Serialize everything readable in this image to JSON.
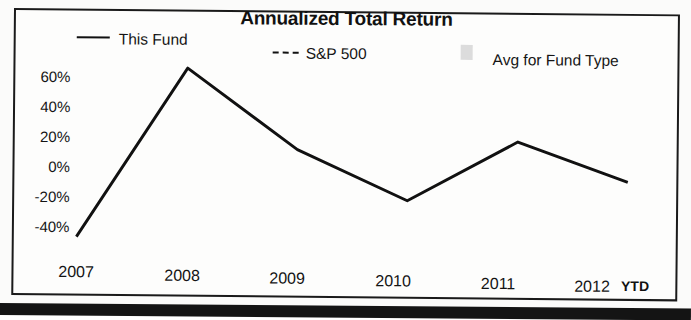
{
  "chart_data": {
    "type": "line",
    "title": "Annualized Total Return",
    "xlabel": "",
    "ylabel": "",
    "categories": [
      "2007",
      "2008",
      "2009",
      "2010",
      "2011",
      "2012"
    ],
    "x_axis_note": "YTD",
    "ylim": [
      -50,
      70
    ],
    "ytick_labels": [
      "60%",
      "40%",
      "20%",
      "0%",
      "-20%",
      "-40%"
    ],
    "ytick_values": [
      60,
      40,
      20,
      0,
      -20,
      -40
    ],
    "grid": false,
    "legend_position": "top",
    "series": [
      {
        "name": "This Fund",
        "style": "solid",
        "color": "#111111",
        "values": [
          -47,
          64,
          11,
          -22,
          17,
          -9
        ]
      },
      {
        "name": "S&P 500",
        "style": "dashed",
        "color": "#111111",
        "values": [
          -44,
          24,
          13,
          -5,
          10,
          6
        ]
      },
      {
        "name": "Avg for Fund Type",
        "style": "shaded-band",
        "color": "#dcdcdc",
        "values": [
          -45,
          38,
          9,
          -24,
          8,
          -10
        ]
      }
    ]
  },
  "legend": {
    "items": [
      {
        "label": "This Fund",
        "marker": "solid-line-icon"
      },
      {
        "label": "S&P 500",
        "marker": "dashed-line-icon"
      },
      {
        "label": "Avg for Fund Type",
        "marker": "gray-swatch-icon"
      }
    ]
  },
  "axis": {
    "y_ticks": [
      "60%",
      "40%",
      "20%",
      "0%",
      "-20%",
      "-40%"
    ],
    "x_ticks": [
      "2007",
      "2008",
      "2009",
      "2010",
      "2011",
      "2012"
    ],
    "ytd_label": "YTD"
  }
}
